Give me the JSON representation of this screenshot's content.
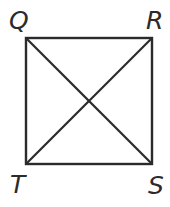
{
  "figure": {
    "kind": "geometry-diagram",
    "background_color": "#ffffff",
    "stroke_color": "#2b2b2b",
    "stroke_width": 2,
    "square": {
      "left": 26,
      "top": 38,
      "right": 152,
      "bottom": 164,
      "width": 126,
      "height": 126
    },
    "vertices": [
      {
        "id": "Q",
        "label": "Q",
        "position": "top-left",
        "x": 26,
        "y": 38
      },
      {
        "id": "R",
        "label": "R",
        "position": "top-right",
        "x": 152,
        "y": 38
      },
      {
        "id": "S",
        "label": "S",
        "position": "bottom-right",
        "x": 152,
        "y": 164
      },
      {
        "id": "T",
        "label": "T",
        "position": "bottom-left",
        "x": 26,
        "y": 164
      }
    ],
    "edges": [
      {
        "id": "QR",
        "from": "Q",
        "to": "R"
      },
      {
        "id": "RS",
        "from": "R",
        "to": "S"
      },
      {
        "id": "ST",
        "from": "S",
        "to": "T"
      },
      {
        "id": "TQ",
        "from": "T",
        "to": "Q"
      }
    ],
    "diagonals": [
      {
        "id": "QS",
        "from": "Q",
        "to": "S"
      },
      {
        "id": "RT",
        "from": "R",
        "to": "T"
      }
    ],
    "intersection": {
      "id": "center",
      "x": 89,
      "y": 101
    }
  }
}
